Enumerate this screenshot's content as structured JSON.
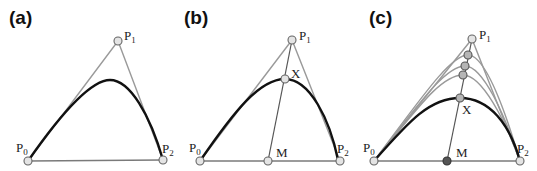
{
  "panels": [
    {
      "label": "(a)",
      "points": {
        "P0": "P",
        "P0_sub": "0",
        "P1": "P",
        "P1_sub": "1",
        "P2": "P",
        "P2_sub": "2"
      }
    },
    {
      "label": "(b)",
      "points": {
        "P0": "P",
        "P0_sub": "0",
        "P1": "P",
        "P1_sub": "1",
        "P2": "P",
        "P2_sub": "2",
        "X": "X",
        "M": "M"
      }
    },
    {
      "label": "(c)",
      "points": {
        "P0": "P",
        "P0_sub": "0",
        "P1": "P",
        "P1_sub": "1",
        "P2": "P",
        "P2_sub": "2",
        "X": "X",
        "M": "M"
      }
    }
  ],
  "colors": {
    "curve": "#111111",
    "hull": "#9a9a9a",
    "point_fill": "#e4e4e4",
    "intermediate_fill": "#b5b5b5",
    "midpoint_fill_c": "#555555"
  }
}
